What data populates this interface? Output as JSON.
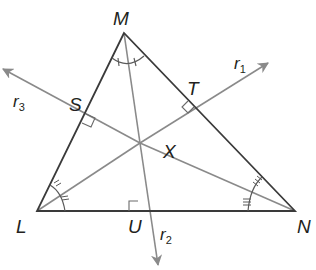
{
  "diagram": {
    "type": "triangle-with-angle-bisectors-and-perpendiculars",
    "colors": {
      "background": "#ffffff",
      "triangle_stroke": "#3a3a3a",
      "ray_stroke": "#8a8a8a",
      "label": "#231f20"
    },
    "vertices": {
      "M": {
        "label": "M",
        "x": 124,
        "y": 33
      },
      "L": {
        "label": "L",
        "x": 37,
        "y": 211
      },
      "N": {
        "label": "N",
        "x": 295,
        "y": 211
      }
    },
    "intersection": {
      "label": "X",
      "x": 140,
      "y": 143
    },
    "feet": {
      "S": {
        "label": "S",
        "x": 82,
        "y": 121
      },
      "T": {
        "label": "T",
        "x": 195,
        "y": 107
      },
      "U": {
        "label": "U",
        "x": 136,
        "y": 211
      }
    },
    "rays": [
      {
        "name": "r1",
        "label": "r",
        "sub": "1"
      },
      {
        "name": "r2",
        "label": "r",
        "sub": "2"
      },
      {
        "name": "r3",
        "label": "r",
        "sub": "3"
      }
    ]
  }
}
